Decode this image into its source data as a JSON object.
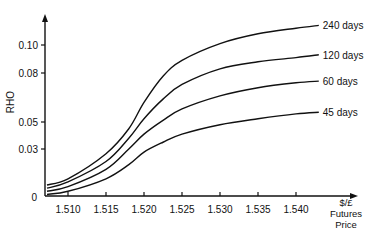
{
  "chart_data": {
    "type": "line",
    "title": "",
    "xlabel": "$/£ Futures Price",
    "xlabel_lines": [
      "$/£",
      "Futures",
      "Price"
    ],
    "ylabel": "RHO",
    "x_ticks": [
      "1.510",
      "1.515",
      "1.520",
      "1.525",
      "1.530",
      "1.535",
      "1.540"
    ],
    "y_ticks": [
      "0",
      "0.03",
      "0.05",
      "0.08",
      "0.10"
    ],
    "xlim": [
      1.507,
      1.546
    ],
    "ylim": [
      0,
      0.13
    ],
    "grid": false,
    "legend_position": "inline-right",
    "x": [
      1.507,
      1.51,
      1.515,
      1.518,
      1.52,
      1.5225,
      1.525,
      1.53,
      1.535,
      1.54,
      1.543
    ],
    "series": [
      {
        "name": "240 days",
        "values": [
          0.007,
          0.011,
          0.027,
          0.045,
          0.062,
          0.078,
          0.089,
          0.101,
          0.108,
          0.112,
          0.114
        ]
      },
      {
        "name": "120 days",
        "values": [
          0.005,
          0.009,
          0.022,
          0.038,
          0.052,
          0.064,
          0.073,
          0.083,
          0.088,
          0.091,
          0.093
        ]
      },
      {
        "name": "60 days",
        "values": [
          0.003,
          0.006,
          0.017,
          0.03,
          0.041,
          0.051,
          0.058,
          0.066,
          0.071,
          0.074,
          0.075
        ]
      },
      {
        "name": "45 days",
        "values": [
          0.001,
          0.003,
          0.011,
          0.02,
          0.028,
          0.035,
          0.041,
          0.048,
          0.052,
          0.055,
          0.056
        ]
      }
    ]
  }
}
